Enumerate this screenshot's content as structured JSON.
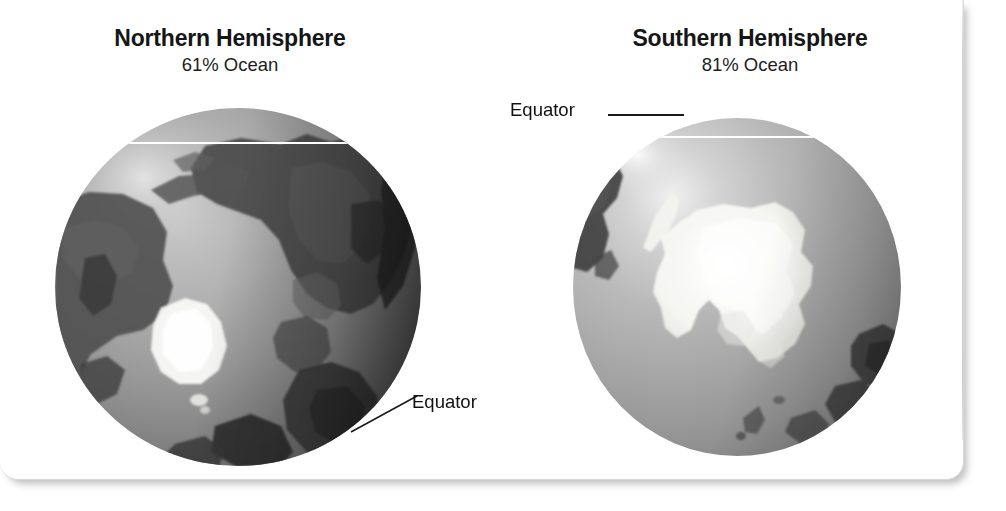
{
  "figure": {
    "panels": [
      {
        "id": "northern",
        "title": "Northern Hemisphere",
        "subtitle": "61% Ocean",
        "ocean_percent": 61,
        "equator_label": "Equator",
        "polar_ice_label": "greenland-ice-sheet"
      },
      {
        "id": "southern",
        "title": "Southern Hemisphere",
        "subtitle": "81% Ocean",
        "ocean_percent": 81,
        "equator_label": "Equator",
        "polar_ice_label": "antarctic-ice-sheet"
      }
    ],
    "colors": {
      "equator_line": "#ffffff",
      "text": "#111111",
      "card_background": "#ffffff",
      "card_border": "#d9d9d9",
      "ice": "#f7f7f5",
      "land_dark": "#3c3c3c",
      "ocean_mid": "#9c9c9c"
    }
  }
}
